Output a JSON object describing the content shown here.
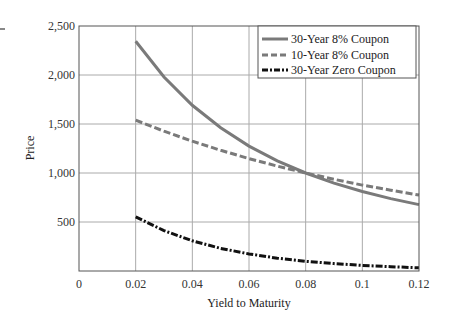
{
  "chart_data": {
    "type": "line",
    "title": "",
    "xlabel": "Yield to Maturity",
    "ylabel": "Price",
    "xlim": [
      0,
      0.12
    ],
    "ylim": [
      0,
      2500
    ],
    "grid": true,
    "legend_position": "upper right",
    "x_ticks": [
      "0",
      "0.02",
      "0.04",
      "0.06",
      "0.08",
      "0.1",
      "0.12"
    ],
    "y_ticks": [
      "500",
      "1,000",
      "1,500",
      "2,000",
      "2,500"
    ],
    "x": [
      0.02,
      0.03,
      0.04,
      0.05,
      0.06,
      0.07,
      0.08,
      0.09,
      0.1,
      0.11,
      0.12
    ],
    "series": [
      {
        "name": "30-Year 8% Coupon",
        "style": "solid",
        "color": "#7a7a7a",
        "values": [
          2344,
          1980,
          1691,
          1461,
          1275,
          1124,
          1000,
          897,
          811,
          739,
          678
        ]
      },
      {
        "name": "10-Year 8% Coupon",
        "style": "dashed",
        "color": "#7a7a7a",
        "values": [
          1539,
          1427,
          1324,
          1232,
          1147,
          1070,
          1000,
          936,
          877,
          824,
          774
        ]
      },
      {
        "name": "30-Year Zero Coupon",
        "style": "dashdot",
        "color": "#111111",
        "values": [
          552,
          412,
          308,
          231,
          174,
          131,
          99,
          75,
          57,
          44,
          33
        ]
      }
    ]
  },
  "labels": {
    "xlabel": "Yield to Maturity",
    "ylabel": "Price",
    "xticks": [
      "0",
      "0.02",
      "0.04",
      "0.06",
      "0.08",
      "0.1",
      "0.12"
    ],
    "yticks": [
      "500",
      "1,000",
      "1,500",
      "2,000",
      "2,500"
    ],
    "legend": [
      "30-Year 8% Coupon",
      "10-Year 8% Coupon",
      "30-Year Zero Coupon"
    ]
  }
}
